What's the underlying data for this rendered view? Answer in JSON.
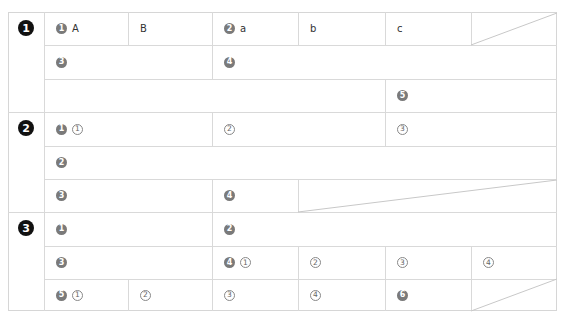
{
  "sections": [
    {
      "number": "1",
      "rows": [
        {
          "cells": [
            {
              "badge": "1",
              "label": "A"
            },
            {
              "label": "B"
            },
            {
              "badge": "2",
              "label": "a"
            },
            {
              "label": "b"
            },
            {
              "label": "c"
            }
          ]
        },
        {
          "cells": [
            {
              "badge": "3"
            },
            {
              "badge": "4"
            }
          ]
        },
        {
          "cells": [
            {
              "badge": "5"
            }
          ]
        }
      ]
    },
    {
      "number": "2",
      "rows": [
        {
          "cells": [
            {
              "badge": "1",
              "circled": "1"
            },
            {
              "circled": "2"
            },
            {
              "circled": "3"
            }
          ]
        },
        {
          "cells": [
            {
              "badge": "2"
            }
          ]
        },
        {
          "cells": [
            {
              "badge": "3"
            },
            {
              "badge": "4"
            }
          ]
        }
      ]
    },
    {
      "number": "3",
      "rows": [
        {
          "cells": [
            {
              "badge": "1"
            },
            {
              "badge": "2"
            }
          ]
        },
        {
          "cells": [
            {
              "badge": "3"
            },
            {
              "badge": "4",
              "circled": "1"
            },
            {
              "circled": "2"
            },
            {
              "circled": "3"
            },
            {
              "circled": "4"
            }
          ]
        },
        {
          "cells": [
            {
              "badge": "5",
              "circled": "1"
            },
            {
              "circled": "2"
            },
            {
              "circled": "3"
            },
            {
              "circled": "4"
            },
            {
              "badge": "6"
            }
          ]
        }
      ]
    }
  ],
  "colors": {
    "border": "#d9d9d9",
    "badge": "#7a7a7a",
    "main_badge": "#111111"
  }
}
